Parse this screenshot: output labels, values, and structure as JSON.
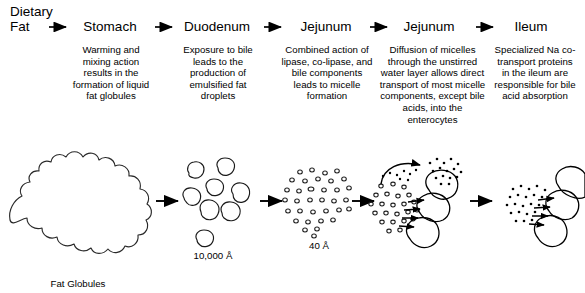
{
  "diagram": {
    "background_color": "#ffffff",
    "ink_color": "#000000",
    "stages": [
      {
        "id": "dietary-fat",
        "organ": "Dietary\nFat",
        "description": ""
      },
      {
        "id": "stomach",
        "organ": "Stomach",
        "description": "Warming and mixing action results in the formation of liquid fat globules"
      },
      {
        "id": "duodenum",
        "organ": "Duodenum",
        "description": "Exposure to bile leads to the production of emulsified fat droplets"
      },
      {
        "id": "jejunum-micelle",
        "organ": "Jejunum",
        "description": "Combined action of lipase, co-lipase, and bile components leads to micelle formation"
      },
      {
        "id": "jejunum-diffusion",
        "organ": "Jejunum",
        "description": "Diffusion of micelles through the unstirred water layer allows direct transport of most micelle components, except bile acids, into the enterocytes"
      },
      {
        "id": "ileum",
        "organ": "Ileum",
        "description": "Specialized Na co-transport proteins in the ileum are responsible for bile acid absorption"
      }
    ],
    "illustration_labels": {
      "fat_globules": "Fat Globules",
      "droplet_scale": "10,000 Å",
      "micelle_scale": "40 Å"
    },
    "arrow_icon": "right-arrow-icon"
  }
}
